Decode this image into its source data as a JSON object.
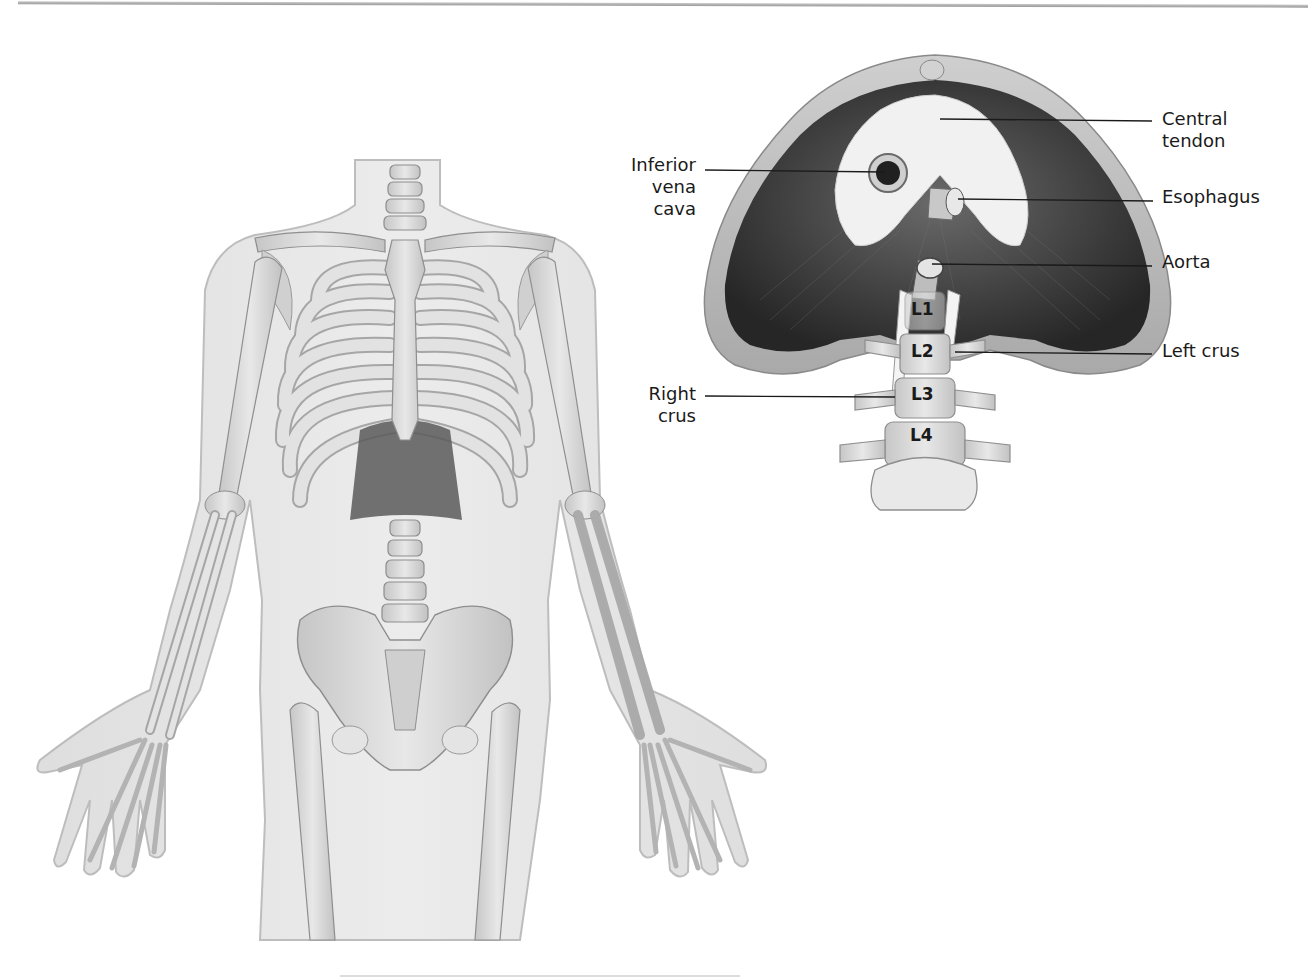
{
  "figure": {
    "left_panel": {
      "description": "Anterior view of human skeleton within translucent body outline, diaphragm visible below rib cage"
    },
    "right_panel": {
      "description": "Inferior view of diaphragm with openings and crura attached to lumbar vertebrae",
      "labels": {
        "central_tendon": [
          "Central",
          "tendon"
        ],
        "inferior_vena_cava": [
          "Inferior",
          "vena",
          "cava"
        ],
        "esophagus": [
          "Esophagus"
        ],
        "aorta": [
          "Aorta"
        ],
        "left_crus": [
          "Left crus"
        ],
        "right_crus": [
          "Right",
          "crus"
        ]
      },
      "vertebrae": [
        "L1",
        "L2",
        "L3",
        "L4"
      ]
    }
  },
  "colors": {
    "body_fill": "#e6e6e6",
    "bone_fill": "#d9d9d9",
    "bone_stroke": "#9a9a9a",
    "muscle_dark": "#3c3c3c",
    "tendon_fill": "#f2f2f2",
    "label_text": "#1a1a1a",
    "leader_line": "#1a1a1a"
  }
}
